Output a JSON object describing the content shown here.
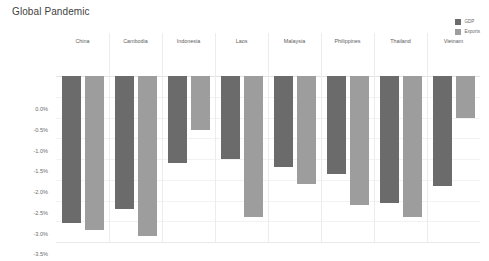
{
  "chart_data": {
    "type": "bar",
    "title": "Global Pandemic",
    "xlabel": "",
    "ylabel": "",
    "ylim": [
      -4.0,
      0.0
    ],
    "yticks": [
      "0.0%",
      "-0.5%",
      "-1.0%",
      "-1.5%",
      "-2.0%",
      "-2.5%",
      "-3.0%",
      "-3.5%",
      "-4.0%"
    ],
    "ytick_values": [
      0.0,
      -0.5,
      -1.0,
      -1.5,
      -2.0,
      -2.5,
      -3.0,
      -3.5,
      -4.0
    ],
    "grid": true,
    "legend_position": "top-right",
    "categories": [
      "China",
      "Cambodia",
      "Indonesia",
      "Laos",
      "Malaysia",
      "Philippines",
      "Thailand",
      "Vietnam"
    ],
    "series": [
      {
        "name": "GDP",
        "color": "#6b6b6b",
        "values": [
          -3.55,
          -3.2,
          -2.1,
          -2.0,
          -2.2,
          -2.35,
          -3.05,
          -2.65
        ]
      },
      {
        "name": "Exports",
        "color": "#9d9d9d",
        "values": [
          -3.7,
          -3.85,
          -1.3,
          -3.4,
          -2.6,
          -3.1,
          -3.4,
          -1.0
        ]
      }
    ]
  },
  "colors": {
    "gdp": "#6b6b6b",
    "exports": "#9d9d9d",
    "grid": "#f2f2f2",
    "zero_line": "#e3e3e3",
    "divider": "#ececec",
    "title_text": "#3f3f3f",
    "tick_text": "#6d6d6d"
  }
}
